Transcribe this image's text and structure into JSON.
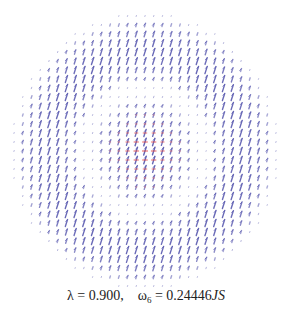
{
  "figure": {
    "caption": {
      "lambda_label": "λ = 0.900,",
      "omega_symbol": "ω",
      "omega_subscript": "6",
      "omega_value": " = 0.24446",
      "omega_unit": "JS"
    }
  },
  "chart_data": {
    "type": "vector-field",
    "title": "",
    "caption": "λ = 0.900, ω6 = 0.24446JS",
    "lambda": 0.9,
    "omega_index": 6,
    "omega_value": 0.24446,
    "omega_unit": "JS",
    "grid": {
      "shape": "disk",
      "columns": 31,
      "rows": 31,
      "center_px": [
        145,
        151
      ],
      "spacing_px": [
        8.73,
        9.0
      ],
      "outer_radius_cells": 15.3,
      "node_ring_radius_cells": 7.0
    },
    "vectors": {
      "primary_color": "#5b5bb0",
      "secondary_color": "#e04848",
      "primary_tilt_deg": 18,
      "max_length_px": 8,
      "secondary_region_radius_cells": 4.2,
      "secondary_max_length_px": 6
    },
    "axes": "none",
    "legend": "none"
  }
}
